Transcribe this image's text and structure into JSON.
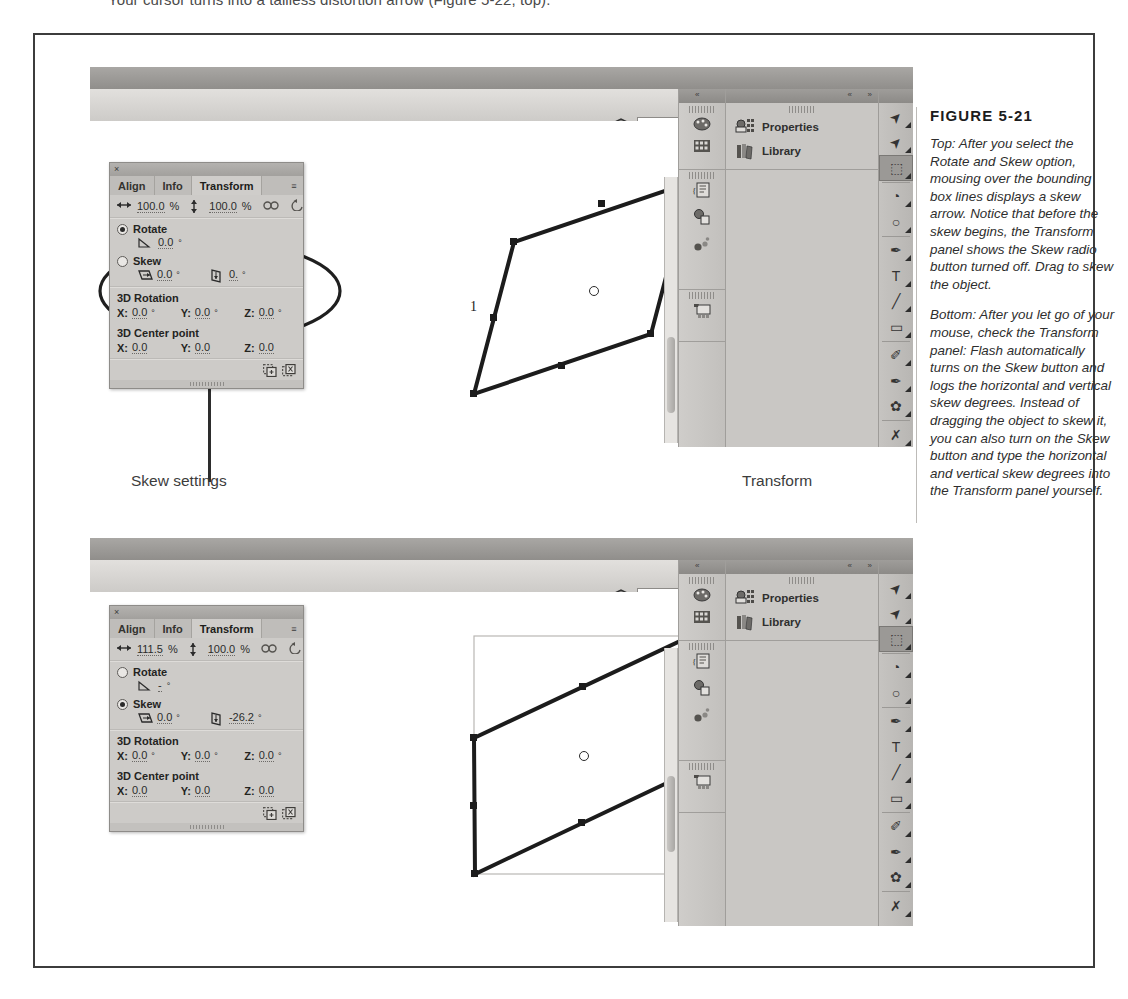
{
  "page": {
    "cut_off_line": "Your cursor turns into a tailless distortion arrow (Figure 5-22, top)."
  },
  "figure": {
    "number_label": "FIGURE 5-21",
    "paragraphs": [
      "Top: After you select the Rotate and Skew option, mousing over the bounding box lines displays a skew arrow. Notice that before the skew begins, the Transform panel shows the Skew radio button turned off. Drag to skew the object.",
      "Bottom: After you let go of your mouse, check the Transform panel: Flash automatically turns on the Skew button and logs the horizontal and vertical skew degrees. Instead of dragging the object to skew it, you can also turn on the Skew button and type the horizontal and vertical skew degrees into the Transform panel yourself."
    ]
  },
  "annotations": {
    "skew_settings": "Skew settings",
    "transform": "Transform"
  },
  "app": {
    "zoom_value": "100%",
    "zoom_placeholder": "100%",
    "icons": {
      "stage_clip": "clip-stage-icon",
      "edit_scene": "edit-scene-icon",
      "zoom_stepper": "stepper-up-down-icon"
    },
    "dock_buttons": [
      {
        "label": "Properties",
        "icon": "properties-icon"
      },
      {
        "label": "Library",
        "icon": "library-books-icon"
      }
    ],
    "collapsed_dock_icons": [
      "color-swatch-palette-icon",
      "color-grid-swatches-icon",
      "actions-script-icon",
      "components-icon",
      "component-inspector-icon",
      "motion-presets-icon"
    ],
    "tools": [
      {
        "name": "selection-arrow-tool",
        "glyph": "➤",
        "selected": false
      },
      {
        "name": "subselection-arrow-tool",
        "glyph": "➤",
        "selected": false
      },
      {
        "name": "free-transform-tool",
        "glyph": "⬚",
        "selected": true
      },
      {
        "name": "3d-rotation-tool",
        "glyph": "◔",
        "selected": false
      },
      {
        "name": "lasso-tool",
        "glyph": "○",
        "selected": false
      },
      {
        "name": "pen-tool",
        "glyph": "✒",
        "selected": false
      },
      {
        "name": "text-tool",
        "glyph": "T",
        "selected": false
      },
      {
        "name": "line-tool",
        "glyph": "╱",
        "selected": false
      },
      {
        "name": "rectangle-tool",
        "glyph": "▭",
        "selected": false
      },
      {
        "name": "pencil-tool",
        "glyph": "✐",
        "selected": false
      },
      {
        "name": "brush-tool",
        "glyph": "✒",
        "selected": false
      },
      {
        "name": "deco-tool",
        "glyph": "✿",
        "selected": false
      },
      {
        "name": "bone-tool",
        "glyph": "✗",
        "selected": false
      },
      {
        "name": "paint-bucket-tool",
        "glyph": "◗",
        "selected": false
      }
    ],
    "dock_chevrons": {
      "left": "«",
      "mid": "«",
      "right": "»"
    }
  },
  "transform_panel_top": {
    "close_glyph": "×",
    "menu_glyph": "≡",
    "tabs": [
      {
        "label": "Align",
        "active": false
      },
      {
        "label": "Info",
        "active": false
      },
      {
        "label": "Transform",
        "active": true
      }
    ],
    "scale_w_icon": "scale-width-icon",
    "scale_w": "100.0",
    "scale_h_icon": "scale-height-icon",
    "scale_h": "100.0",
    "percent": "%",
    "link_icon": "constrain-link-icon",
    "reset_icon": "reset-transform-icon",
    "rotate_label": "Rotate",
    "rotate_selected": true,
    "rotate_angle_icon": "angle-icon",
    "rotate_angle": "0.0",
    "skew_label": "Skew",
    "skew_selected": false,
    "skew_h_icon": "skew-horizontal-icon",
    "skew_h": "0.0",
    "skew_v_icon": "skew-vertical-icon",
    "skew_v": "0.",
    "deg": "°",
    "rot3d_label": "3D Rotation",
    "rot3d": [
      {
        "axis": "X:",
        "value": "0.0",
        "unit": "°"
      },
      {
        "axis": "Y:",
        "value": "0.0",
        "unit": "°"
      },
      {
        "axis": "Z:",
        "value": "0.0",
        "unit": "°"
      }
    ],
    "center3d_label": "3D Center point",
    "center3d": [
      {
        "axis": "X:",
        "value": "0.0",
        "unit": ""
      },
      {
        "axis": "Y:",
        "value": "0.0",
        "unit": ""
      },
      {
        "axis": "Z:",
        "value": "0.0",
        "unit": ""
      }
    ],
    "footer_icons": [
      "duplicate-selection-icon",
      "remove-transform-icon"
    ]
  },
  "transform_panel_bottom": {
    "close_glyph": "×",
    "menu_glyph": "≡",
    "tabs": [
      {
        "label": "Align",
        "active": false
      },
      {
        "label": "Info",
        "active": false
      },
      {
        "label": "Transform",
        "active": true
      }
    ],
    "scale_w_icon": "scale-width-icon",
    "scale_w": "111.5",
    "scale_h_icon": "scale-height-icon",
    "scale_h": "100.0",
    "percent": "%",
    "link_icon": "constrain-link-icon",
    "reset_icon": "reset-transform-icon",
    "rotate_label": "Rotate",
    "rotate_selected": false,
    "rotate_angle_icon": "angle-icon",
    "rotate_angle": "-",
    "skew_label": "Skew",
    "skew_selected": true,
    "skew_h_icon": "skew-horizontal-icon",
    "skew_h": "0.0",
    "skew_v_icon": "skew-vertical-icon",
    "skew_v": "-26.2",
    "deg": "°",
    "rot3d_label": "3D Rotation",
    "rot3d": [
      {
        "axis": "X:",
        "value": "0.0",
        "unit": "°"
      },
      {
        "axis": "Y:",
        "value": "0.0",
        "unit": "°"
      },
      {
        "axis": "Z:",
        "value": "0.0",
        "unit": "°"
      }
    ],
    "center3d_label": "3D Center point",
    "center3d": [
      {
        "axis": "X:",
        "value": "0.0",
        "unit": ""
      },
      {
        "axis": "Y:",
        "value": "0.0",
        "unit": ""
      },
      {
        "axis": "Z:",
        "value": "0.0",
        "unit": ""
      }
    ],
    "footer_icons": [
      "duplicate-selection-icon",
      "remove-transform-icon"
    ]
  },
  "stage_top": {
    "cursor_label": "1",
    "shape_name": "skewed-parallelogram-selection"
  },
  "stage_bottom": {
    "shape_name": "skewed-parallelogram-selection",
    "bounding_box_name": "original-bounding-box"
  },
  "colors": {
    "frame_border": "#3c3c3c",
    "chrome_light": "#e2e0dd",
    "chrome_mid": "#cdcbc8",
    "chrome_dark": "#908e8b",
    "stage_white": "#ffffff",
    "shape_stroke": "#1c1c1c",
    "text_dark": "#2e2e2e"
  }
}
